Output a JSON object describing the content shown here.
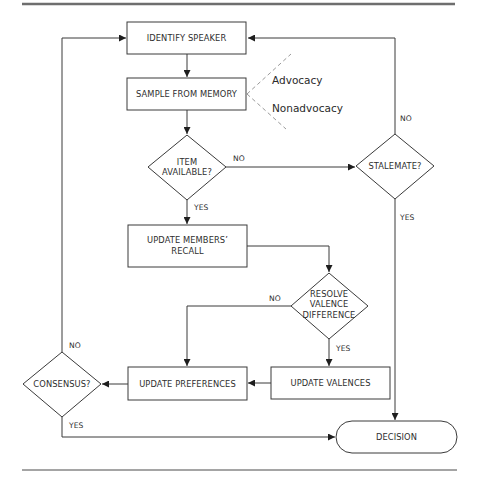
{
  "diagram": {
    "type": "flowchart",
    "rules": {
      "top_color": "#6e6e6e",
      "bottom_color": "#4a4a4a"
    },
    "nodes": {
      "identify_speaker": {
        "label": "IDENTIFY SPEAKER",
        "shape": "rect"
      },
      "sample_memory": {
        "label": "SAMPLE FROM MEMORY",
        "shape": "rect"
      },
      "item_available": {
        "line1": "ITEM",
        "line2": "AVAILABLE?",
        "shape": "diamond"
      },
      "stalemate": {
        "label": "STALEMATE?",
        "shape": "diamond"
      },
      "update_recall": {
        "line1": "UPDATE MEMBERS’",
        "line2": "RECALL",
        "shape": "rect"
      },
      "resolve_valence": {
        "line1": "RESOLVE",
        "line2": "VALENCE",
        "line3": "DIFFERENCE",
        "shape": "diamond"
      },
      "update_preferences": {
        "label": "UPDATE PREFERENCES",
        "shape": "rect"
      },
      "update_valences": {
        "label": "UPDATE VALENCES",
        "shape": "rect"
      },
      "consensus": {
        "label": "CONSENSUS?",
        "shape": "diamond"
      },
      "decision": {
        "label": "DECISION",
        "shape": "terminal"
      }
    },
    "annotations": {
      "advocacy": "Advocacy",
      "nonadvocacy": "Nonadvocacy"
    },
    "edge_labels": {
      "item_no": "NO",
      "item_yes": "YES",
      "stalemate_no": "NO",
      "stalemate_yes": "YES",
      "resolve_no": "NO",
      "resolve_yes": "YES",
      "consensus_no": "NO",
      "consensus_yes": "YES"
    },
    "edges": [
      {
        "from": "identify_speaker",
        "to": "sample_memory"
      },
      {
        "from": "sample_memory",
        "to": "item_available"
      },
      {
        "from": "item_available",
        "to": "stalemate",
        "label": "NO"
      },
      {
        "from": "item_available",
        "to": "update_recall",
        "label": "YES"
      },
      {
        "from": "stalemate",
        "to": "identify_speaker",
        "label": "NO"
      },
      {
        "from": "stalemate",
        "to": "decision",
        "label": "YES"
      },
      {
        "from": "update_recall",
        "to": "resolve_valence"
      },
      {
        "from": "resolve_valence",
        "to": "update_preferences",
        "label": "NO"
      },
      {
        "from": "resolve_valence",
        "to": "update_valences",
        "label": "YES"
      },
      {
        "from": "update_valences",
        "to": "update_preferences"
      },
      {
        "from": "update_preferences",
        "to": "consensus"
      },
      {
        "from": "consensus",
        "to": "identify_speaker",
        "label": "NO"
      },
      {
        "from": "consensus",
        "to": "decision",
        "label": "YES"
      }
    ]
  }
}
